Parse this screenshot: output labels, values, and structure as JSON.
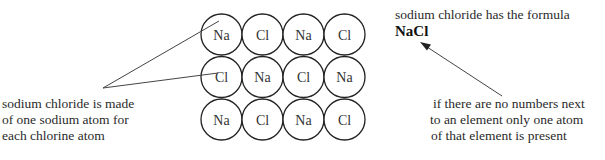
{
  "diagram": {
    "lattice": {
      "rows": [
        [
          "Na",
          "Cl",
          "Na",
          "Cl"
        ],
        [
          "Cl",
          "Na",
          "Cl",
          "Na"
        ],
        [
          "Na",
          "Cl",
          "Na",
          "Cl"
        ]
      ]
    },
    "left_note": {
      "lines": [
        "sodium chloride is made",
        "of one sodium atom for",
        "each chlorine atom"
      ]
    },
    "formula_note": {
      "text": "sodium chloride has the formula",
      "formula": "NaCl"
    },
    "right_note": {
      "lines": [
        "if there are no numbers next",
        "to an element only one atom",
        "of that element is present"
      ]
    }
  }
}
